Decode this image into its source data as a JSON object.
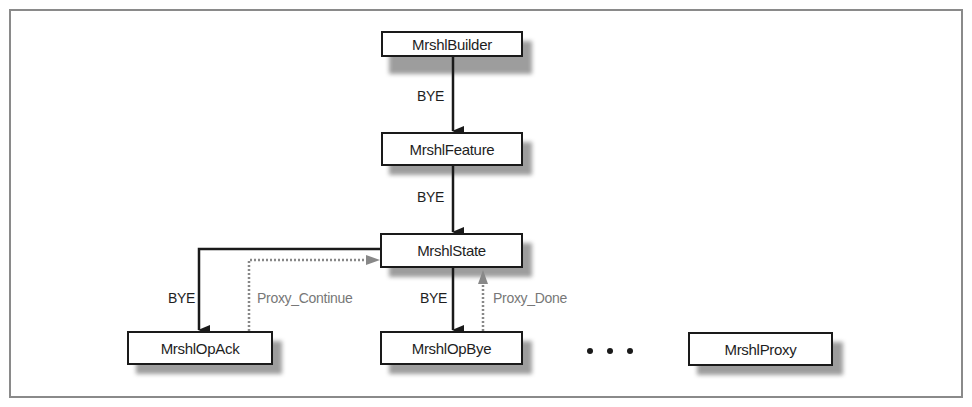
{
  "diagram": {
    "nodes": [
      {
        "id": "builder",
        "label": "MrshlBuilder"
      },
      {
        "id": "feature",
        "label": "MrshlFeature"
      },
      {
        "id": "state",
        "label": "MrshlState"
      },
      {
        "id": "opack",
        "label": "MrshlOpAck"
      },
      {
        "id": "opbye",
        "label": "MrshlOpBye"
      },
      {
        "id": "proxy",
        "label": "MrshlProxy"
      }
    ],
    "edges": [
      {
        "from": "builder",
        "to": "feature",
        "label": "BYE",
        "style": "solid"
      },
      {
        "from": "feature",
        "to": "state",
        "label": "BYE",
        "style": "solid"
      },
      {
        "from": "state",
        "to": "opack",
        "label": "BYE",
        "style": "solid"
      },
      {
        "from": "opack",
        "to": "state",
        "label": "Proxy_Continue",
        "style": "dotted"
      },
      {
        "from": "state",
        "to": "opbye",
        "label": "BYE",
        "style": "solid"
      },
      {
        "from": "opbye",
        "to": "state",
        "label": "Proxy_Done",
        "style": "dotted"
      }
    ],
    "ellipsis": "...",
    "colors": {
      "solid": "#1a1a1a",
      "dotted": "#888888",
      "shadow": "#8c8c8c",
      "frame": "#8a8a8a"
    }
  }
}
